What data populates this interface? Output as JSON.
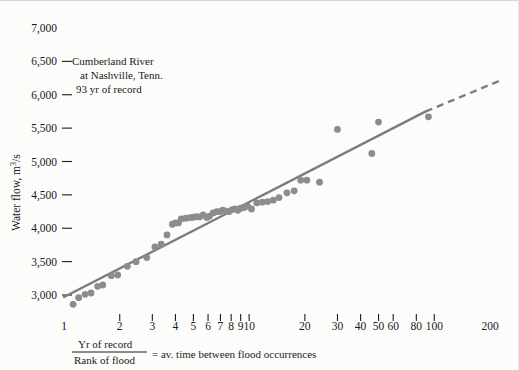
{
  "chart_data": {
    "type": "scatter",
    "title": "",
    "xlabel": "Yr of record / Rank of flood = av. time between flood occurrences",
    "ylabel": "Water flow, m3/s",
    "xscale": "log",
    "xlim": [
      1,
      200
    ],
    "ylim": [
      2700,
      7050
    ],
    "grid": false,
    "legend": null,
    "annotation": {
      "line1": "Cumberland River",
      "line2": "at Nashville, Tenn.",
      "line3": "93 yr of record"
    },
    "xticks": [
      1,
      2,
      3,
      4,
      5,
      6,
      7,
      8,
      9,
      10,
      20,
      30,
      40,
      50,
      60,
      80,
      100,
      200
    ],
    "xtick_labels": [
      "1",
      "2",
      "3",
      "4",
      "5",
      "6",
      "7",
      "8",
      "9",
      "10",
      "20",
      "30",
      "40",
      "50",
      "60",
      "80",
      "100",
      "200"
    ],
    "yticks": [
      3000,
      3500,
      4000,
      4500,
      5000,
      5500,
      6000,
      6500,
      7000
    ],
    "ytick_labels": [
      "3,000",
      "3,500",
      "4,000",
      "4,500",
      "5,000",
      "5,500",
      "6,000",
      "6,500",
      "7,000"
    ],
    "series": [
      {
        "name": "Annual flood peaks",
        "marker": "circle",
        "color": "#8c8c8c",
        "points": [
          [
            1.12,
            2860
          ],
          [
            1.2,
            2960
          ],
          [
            1.3,
            3010
          ],
          [
            1.4,
            3030
          ],
          [
            1.52,
            3130
          ],
          [
            1.62,
            3150
          ],
          [
            1.8,
            3290
          ],
          [
            1.95,
            3300
          ],
          [
            2.2,
            3430
          ],
          [
            2.45,
            3500
          ],
          [
            2.8,
            3560
          ],
          [
            3.1,
            3720
          ],
          [
            3.35,
            3760
          ],
          [
            3.6,
            3900
          ],
          [
            3.85,
            4060
          ],
          [
            4.0,
            4080
          ],
          [
            4.15,
            4080
          ],
          [
            4.3,
            4140
          ],
          [
            4.55,
            4150
          ],
          [
            4.8,
            4160
          ],
          [
            5.0,
            4165
          ],
          [
            5.2,
            4175
          ],
          [
            5.4,
            4170
          ],
          [
            5.65,
            4200
          ],
          [
            5.9,
            4160
          ],
          [
            6.1,
            4180
          ],
          [
            6.4,
            4230
          ],
          [
            6.7,
            4250
          ],
          [
            6.95,
            4250
          ],
          [
            7.2,
            4270
          ],
          [
            7.5,
            4255
          ],
          [
            7.8,
            4250
          ],
          [
            8.1,
            4280
          ],
          [
            8.4,
            4290
          ],
          [
            8.7,
            4270
          ],
          [
            9.0,
            4300
          ],
          [
            9.4,
            4310
          ],
          [
            9.8,
            4330
          ],
          [
            10.3,
            4290
          ],
          [
            11.0,
            4380
          ],
          [
            11.8,
            4390
          ],
          [
            12.6,
            4400
          ],
          [
            13.5,
            4420
          ],
          [
            14.5,
            4460
          ],
          [
            16.0,
            4530
          ],
          [
            17.5,
            4560
          ],
          [
            19.0,
            4720
          ],
          [
            20.5,
            4720
          ],
          [
            24.0,
            4690
          ],
          [
            30.0,
            5480
          ],
          [
            46.0,
            5120
          ],
          [
            50.0,
            5590
          ],
          [
            93.0,
            5670
          ]
        ]
      }
    ],
    "fit_line": {
      "name": "Frequency curve",
      "color": "#7d7d7d",
      "solid_from": [
        1.0,
        2970
      ],
      "solid_to": [
        90.0,
        5750
      ],
      "dashed_from": [
        90.0,
        5750
      ],
      "dashed_to": [
        230.0,
        6220
      ]
    }
  },
  "caption": {
    "numerator": "Yr of record",
    "denominator": "Rank of flood",
    "equals": "= av. time between flood occurrences"
  },
  "ylabel": {
    "pre": "Water flow, m",
    "sup": "3",
    "post": "/s"
  }
}
